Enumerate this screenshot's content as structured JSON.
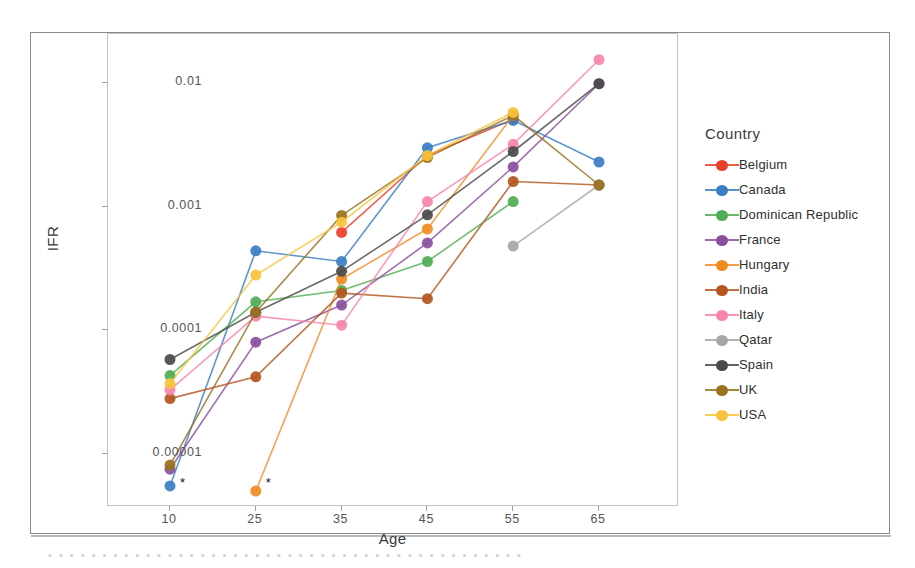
{
  "chart_data": {
    "type": "line",
    "title": "",
    "xlabel": "Age",
    "ylabel": "IFR",
    "legend_title": "Country",
    "legend_position": "right",
    "grid": false,
    "yscale": "log",
    "ylim": [
      5e-06,
      0.02
    ],
    "yticks": [
      1e-05,
      0.0001,
      0.001,
      0.01
    ],
    "ytick_labels": [
      "0.00001",
      "0.0001",
      "0.001",
      "0.01"
    ],
    "x": [
      10,
      25,
      35,
      45,
      55,
      65
    ],
    "xtick_labels": [
      "10",
      "25",
      "35",
      "45",
      "55",
      "65"
    ],
    "annotations": [
      {
        "text": "*",
        "x": 10,
        "note": "censored-zero at age 10"
      },
      {
        "text": "*",
        "x": 25,
        "note": "censored-zero at age 25"
      }
    ],
    "series": [
      {
        "name": "Belgium",
        "color": "#e8412c",
        "x": [
          35,
          45,
          55,
          65
        ],
        "values": [
          0.00062,
          0.0026,
          0.0051,
          null
        ]
      },
      {
        "name": "Canada",
        "color": "#3a7ec4",
        "x": [
          10,
          25,
          35,
          45,
          55,
          65
        ],
        "values": [
          5.5e-06,
          0.00044,
          0.00036,
          0.003,
          0.005,
          0.0023
        ]
      },
      {
        "name": "Dominican Republic",
        "color": "#4fad54",
        "x": [
          10,
          25,
          35,
          45,
          55
        ],
        "values": [
          4.3e-05,
          0.00017,
          0.00021,
          0.00036,
          0.0011
        ]
      },
      {
        "name": "France",
        "color": "#8a4f9e",
        "x": [
          10,
          25,
          35,
          45,
          55,
          65
        ],
        "values": [
          7.5e-06,
          8e-05,
          0.00016,
          0.00051,
          0.0021,
          0.0099
        ]
      },
      {
        "name": "Hungary",
        "color": "#f08b22",
        "x": [
          25,
          35,
          45,
          55
        ],
        "values": [
          5e-06,
          0.00026,
          0.00066,
          0.0055
        ]
      },
      {
        "name": "India",
        "color": "#b4561f",
        "x": [
          10,
          25,
          35,
          45,
          55,
          65
        ],
        "values": [
          2.8e-05,
          4.2e-05,
          0.0002,
          0.00018,
          0.0016,
          0.0015
        ]
      },
      {
        "name": "Italy",
        "color": "#f585ab",
        "x": [
          10,
          25,
          35,
          45,
          55,
          65
        ],
        "values": [
          3.3e-05,
          0.00013,
          0.00011,
          0.0011,
          0.0032,
          0.0155
        ]
      },
      {
        "name": "Qatar",
        "color": "#a6a6a6",
        "x": [
          55,
          65
        ],
        "values": [
          0.00048,
          0.0015
        ]
      },
      {
        "name": "Spain",
        "color": "#4a4a4a",
        "x": [
          10,
          25,
          35,
          45,
          55,
          65
        ],
        "values": [
          5.8e-05,
          0.00014,
          0.0003,
          0.00086,
          0.0028,
          0.0099
        ]
      },
      {
        "name": "UK",
        "color": "#9a7220",
        "x": [
          10,
          25,
          35,
          45,
          55,
          65
        ],
        "values": [
          8.1e-06,
          0.00014,
          0.00085,
          0.0025,
          0.0055,
          0.0015
        ]
      },
      {
        "name": "USA",
        "color": "#f9c23c",
        "x": [
          10,
          25,
          35,
          45,
          55
        ],
        "values": [
          3.7e-05,
          0.00028,
          0.00075,
          0.0026,
          0.0058
        ]
      }
    ]
  },
  "figure": {
    "caption_strip": "• • • • • • • • • • • • • • • • • • • • • • • • • • • • • • • • • • • • • • • • • • • •"
  }
}
